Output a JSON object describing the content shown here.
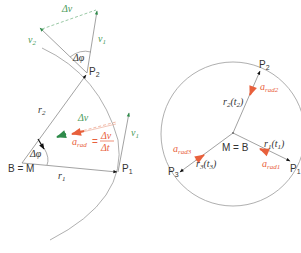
{
  "colors": {
    "line": "#8a8a8a",
    "arc": "#9a9a9a",
    "text": "#333333",
    "velocity": "#2e8b4a",
    "velocity_text": "#4a9a5a",
    "acceleration": "#e8603c",
    "arrowhead": "#111111"
  },
  "left_diagram": {
    "center_label": "B = M",
    "points": {
      "p1": {
        "base": "P",
        "sub": "1"
      },
      "p2": {
        "base": "P",
        "sub": "2"
      }
    },
    "vectors": {
      "r1": {
        "base": "r",
        "sub": "1"
      },
      "r2": {
        "base": "r",
        "sub": "2"
      },
      "v1_top": {
        "base": "v",
        "sub": "1"
      },
      "v2_top": {
        "base": "v",
        "sub": "2"
      },
      "v1_right": {
        "base": "v",
        "sub": "1"
      },
      "delta_v_top": "Δv",
      "delta_v_mid": "Δv"
    },
    "angles": {
      "at_p2": "Δφ",
      "at_center": "Δφ"
    },
    "formula": {
      "lhs_base": "a",
      "lhs_sub": "rad",
      "equals": "=",
      "numerator": "Δv",
      "denominator": "Δt"
    }
  },
  "right_diagram": {
    "center_label": "M = B",
    "points": {
      "p1": {
        "base": "P",
        "sub": "1"
      },
      "p2": {
        "base": "P",
        "sub": "2"
      },
      "p3": {
        "base": "P",
        "sub": "3"
      }
    },
    "radius_vectors": [
      {
        "base": "r",
        "sub": "1",
        "arg": "t",
        "arg_sub": "1"
      },
      {
        "base": "r",
        "sub": "2",
        "arg": "t",
        "arg_sub": "2"
      },
      {
        "base": "r",
        "sub": "3",
        "arg": "t",
        "arg_sub": "3"
      }
    ],
    "accelerations": [
      {
        "base": "a",
        "sub": "rad1"
      },
      {
        "base": "a",
        "sub": "rad2"
      },
      {
        "base": "a",
        "sub": "rad3"
      }
    ]
  }
}
